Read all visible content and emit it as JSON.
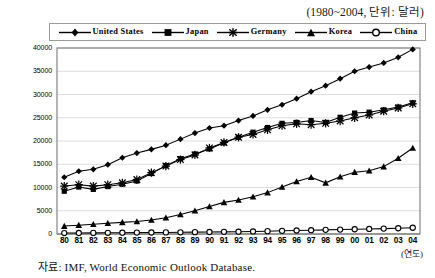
{
  "header": {
    "unit_note": "(1980~2004, 단위: 달러)"
  },
  "footer": {
    "source": "자료: IMF, World Economic Outlook Database.",
    "year_unit": "(연도)"
  },
  "axis": {
    "y_ticks": [
      "0",
      "5000",
      "10000",
      "15000",
      "20000",
      "25000",
      "30000",
      "35000",
      "40000"
    ],
    "x_ticks": [
      "80",
      "81",
      "82",
      "83",
      "84",
      "85",
      "86",
      "87",
      "88",
      "89",
      "90",
      "91",
      "92",
      "93",
      "94",
      "95",
      "96",
      "97",
      "98",
      "99",
      "00",
      "01",
      "02",
      "03",
      "04"
    ]
  },
  "legend": [
    {
      "label": "United States",
      "marker": "diamond-marker"
    },
    {
      "label": "Japan",
      "marker": "square-marker"
    },
    {
      "label": "Germany",
      "marker": "asterisk-marker"
    },
    {
      "label": "Korea",
      "marker": "triangle-marker"
    },
    {
      "label": "China",
      "marker": "circle-marker"
    }
  ],
  "chart_data": {
    "type": "line",
    "title": "",
    "subtitle": "(1980~2004, 단위: 달러)",
    "xlabel": "(연도)",
    "ylabel": "",
    "ylim": [
      0,
      40000
    ],
    "ytick_step": 5000,
    "grid": true,
    "legend_position": "top",
    "x": [
      "80",
      "81",
      "82",
      "83",
      "84",
      "85",
      "86",
      "87",
      "88",
      "89",
      "90",
      "91",
      "92",
      "93",
      "94",
      "95",
      "96",
      "97",
      "98",
      "99",
      "00",
      "01",
      "02",
      "03",
      "04"
    ],
    "x_full_years": [
      1980,
      1981,
      1982,
      1983,
      1984,
      1985,
      1986,
      1987,
      1988,
      1989,
      1990,
      1991,
      1992,
      1993,
      1994,
      1995,
      1996,
      1997,
      1998,
      1999,
      2000,
      2001,
      2002,
      2003,
      2004
    ],
    "series": [
      {
        "name": "United States",
        "marker": "diamond",
        "values": [
          12200,
          13500,
          13900,
          14900,
          16400,
          17400,
          18200,
          19100,
          20400,
          21700,
          22800,
          23300,
          24400,
          25400,
          26700,
          27800,
          29100,
          30600,
          31900,
          33400,
          35000,
          35900,
          36800,
          38000,
          39700
        ]
      },
      {
        "name": "Japan",
        "marker": "square",
        "values": [
          9200,
          10100,
          9600,
          10200,
          10700,
          11400,
          13000,
          14700,
          16200,
          17200,
          18300,
          19600,
          20800,
          21900,
          22900,
          23800,
          24000,
          24400,
          24000,
          25100,
          26000,
          26200,
          26700,
          27300,
          28200
        ]
      },
      {
        "name": "Germany",
        "marker": "asterisk",
        "values": [
          10300,
          10600,
          10300,
          10600,
          11000,
          11700,
          13200,
          14600,
          16000,
          17000,
          18500,
          19700,
          20800,
          21400,
          22400,
          23300,
          23700,
          23500,
          23800,
          24300,
          25000,
          25600,
          26400,
          27100,
          28000
        ]
      },
      {
        "name": "Korea",
        "marker": "triangle",
        "values": [
          1700,
          1900,
          2100,
          2300,
          2500,
          2700,
          3000,
          3500,
          4200,
          5000,
          5900,
          6800,
          7300,
          8000,
          8900,
          10100,
          11300,
          12200,
          11000,
          12300,
          13300,
          13600,
          14500,
          16300,
          18500
        ]
      },
      {
        "name": "China",
        "marker": "circle",
        "values": [
          200,
          220,
          240,
          260,
          280,
          300,
          320,
          340,
          370,
          400,
          430,
          460,
          500,
          550,
          610,
          680,
          750,
          820,
          890,
          950,
          1020,
          1090,
          1160,
          1240,
          1340
        ]
      }
    ]
  }
}
